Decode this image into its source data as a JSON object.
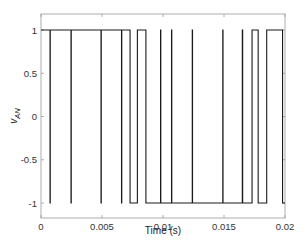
{
  "chart_data": {
    "type": "line",
    "title": "",
    "xlabel": "Time (s)",
    "ylabel": "v_AN",
    "ylabel_main": "v",
    "ylabel_sub": "AN",
    "xlim": [
      0,
      0.02
    ],
    "ylim": [
      -1.2,
      1.2
    ],
    "grid": false,
    "legend": null,
    "x_ticks": [
      0,
      0.005,
      0.01,
      0.015,
      0.02
    ],
    "x_tick_labels": [
      "0",
      "0.005",
      "0.01",
      "0.015",
      "0.02"
    ],
    "y_ticks": [
      1,
      0.5,
      0,
      -0.5,
      -1
    ],
    "y_tick_labels": [
      "1",
      "0.5",
      "0",
      "-0.5",
      "-1"
    ],
    "line_color": "#1a1a1a",
    "series": [
      {
        "name": "v_AN",
        "style": "step",
        "initial_value": 1,
        "x": [
          0,
          0.00074,
          0.00076,
          0.00246,
          0.00248,
          0.00492,
          0.00494,
          0.0066,
          0.00662,
          0.0073,
          0.0079,
          0.0086,
          0.0098,
          0.00982,
          0.0107,
          0.01072,
          0.0124,
          0.01242,
          0.0149,
          0.01492,
          0.0165,
          0.01653,
          0.0173,
          0.0178,
          0.0185,
          0.0198,
          0.02
        ],
        "y": [
          1,
          -1,
          1,
          -1,
          1,
          -1,
          1,
          -1,
          1,
          -1,
          1,
          -1,
          1,
          -1,
          1,
          -1,
          1,
          -1,
          1,
          -1,
          1,
          -1,
          1,
          -1,
          1,
          -1,
          -1
        ]
      }
    ]
  }
}
